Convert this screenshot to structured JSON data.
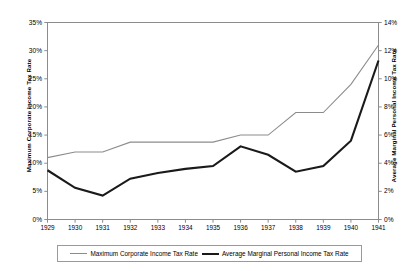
{
  "chart_data": {
    "type": "line",
    "title": "",
    "xlabel": "",
    "grid": false,
    "legend_position": "bottom",
    "categories": [
      1929,
      1930,
      1931,
      1932,
      1933,
      1934,
      1935,
      1936,
      1937,
      1938,
      1939,
      1940,
      1941
    ],
    "x_tick_labels": [
      "1929",
      "1930",
      "1931",
      "1932",
      "1933",
      "1934",
      "1935",
      "1936",
      "1937",
      "1938",
      "1939",
      "1940",
      "1941"
    ],
    "axes": {
      "left": {
        "label": "Maximum Corporate Income Tax Rate",
        "ylim": [
          0,
          35
        ],
        "ticks": [
          0,
          5,
          10,
          15,
          20,
          25,
          30,
          35
        ],
        "tick_labels": [
          "0%",
          "5%",
          "10%",
          "15%",
          "20%",
          "25%",
          "30%",
          "35%"
        ],
        "unit": "%"
      },
      "right": {
        "label": "Average Marginal Personal Income Tax Rate",
        "ylim": [
          0,
          14
        ],
        "ticks": [
          0,
          2,
          4,
          6,
          8,
          10,
          12,
          14
        ],
        "tick_labels": [
          "0%",
          "2%",
          "4%",
          "6%",
          "8%",
          "10%",
          "12%",
          "14%"
        ],
        "unit": "%"
      }
    },
    "series": [
      {
        "name": "Maximum Corporate Income Tax Rate",
        "axis": "left",
        "color": "#8c8c8c",
        "line_width": 1.1,
        "values": [
          11.0,
          12.0,
          12.0,
          13.75,
          13.75,
          13.75,
          13.75,
          15.0,
          15.0,
          19.0,
          19.0,
          24.0,
          31.0
        ]
      },
      {
        "name": "Average Marginal Personal Income Tax Rate",
        "axis": "right",
        "color": "#1a1a1a",
        "line_width": 2.1,
        "values": [
          3.5,
          2.25,
          1.7,
          2.9,
          3.3,
          3.6,
          3.8,
          5.2,
          4.6,
          3.4,
          3.8,
          5.6,
          11.3
        ]
      }
    ]
  },
  "legend": {
    "entries": [
      {
        "label": "Maximum Corporate Income Tax Rate",
        "style": "thin-gray"
      },
      {
        "label": "Average Marginal Personal Income Tax Rate",
        "style": "thick-black"
      }
    ]
  },
  "colors": {
    "corporate_line": "#8c8c8c",
    "personal_line": "#1a1a1a",
    "axis": "#8c8c8c",
    "plot_border": "#8c8c8c",
    "background": "#ffffff"
  }
}
